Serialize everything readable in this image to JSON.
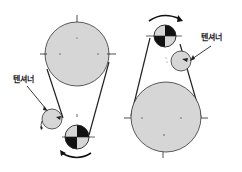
{
  "diagram": {
    "left": {
      "tensioner_label": "텐셔너"
    },
    "right": {
      "tensioner_label": "텐셔너"
    },
    "colors": {
      "pulley_fill": "#d6d6d6",
      "line": "#222222",
      "dark": "#111111",
      "background": "#ffffff"
    }
  }
}
